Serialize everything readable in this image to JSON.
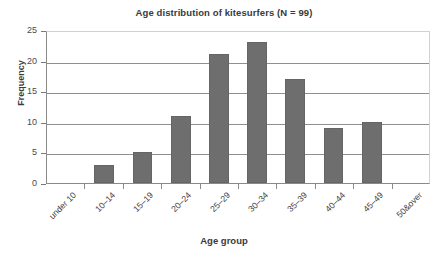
{
  "chart_data": {
    "type": "bar",
    "title": "Age distribution of kitesurfers (N = 99)",
    "xlabel": "Age group",
    "ylabel": "Frequency",
    "categories": [
      "under 10",
      "10–14",
      "15–19",
      "20–24",
      "25–29",
      "30–34",
      "35–39",
      "40–44",
      "45–49",
      "50&over"
    ],
    "values": [
      0,
      3,
      5,
      11,
      21,
      23,
      17,
      9,
      10,
      0
    ],
    "ylim": [
      0,
      25
    ],
    "yticks": [
      0,
      5,
      10,
      15,
      20,
      25
    ],
    "ytick_labels": [
      "0",
      "5",
      "10",
      "15",
      "20",
      "25"
    ],
    "grid": true,
    "legend": false,
    "bar_color": "#6e6e6e",
    "axis_color": "#8a8a8a",
    "background": "#ffffff"
  }
}
